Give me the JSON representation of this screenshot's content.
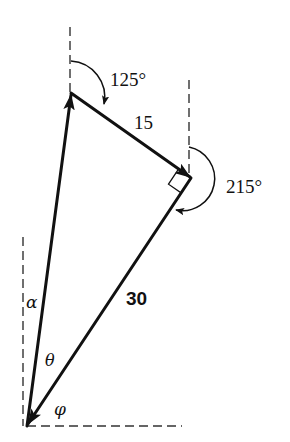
{
  "diagram": {
    "type": "vector-triangle",
    "colors": {
      "stroke": "#111111",
      "dash": "#333333",
      "background": "#ffffff"
    },
    "labels": {
      "angle_top": "125°",
      "angle_right": "215°",
      "side_top": "15",
      "side_right": "30",
      "alpha": "α",
      "theta": "θ",
      "phi": "φ"
    },
    "points": {
      "bottom": [
        27,
        426
      ],
      "top": [
        71,
        93
      ],
      "right": [
        191,
        178
      ]
    },
    "vectors": [
      {
        "from": "bottom",
        "to": "top",
        "label": ""
      },
      {
        "from": "top",
        "to": "right",
        "label": "15"
      },
      {
        "from": "right",
        "to": "bottom",
        "label": "30"
      }
    ],
    "angles": [
      {
        "at": "top",
        "value": "125°",
        "reference": "north"
      },
      {
        "at": "right",
        "value": "215°",
        "reference": "north"
      },
      {
        "at": "bottom",
        "value": "α",
        "between": "north and vector to top"
      },
      {
        "at": "bottom",
        "value": "θ",
        "between": "two vectors"
      },
      {
        "at": "bottom",
        "value": "φ",
        "between": "vector from right and east"
      }
    ],
    "right_angle_marker": "right"
  }
}
